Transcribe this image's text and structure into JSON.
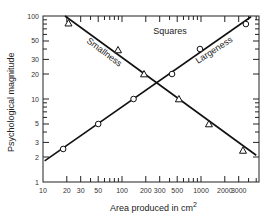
{
  "chart_data": {
    "type": "scatter",
    "title": "Squares",
    "xlabel": "Area produced in cm",
    "xlabel_superscript": "2",
    "ylabel": "Psychological magnitude",
    "xscale": "log",
    "yscale": "log",
    "xlim": [
      10,
      5500
    ],
    "ylim": [
      1,
      100
    ],
    "grid": false,
    "legend": "inline labels on lines",
    "x_ticks": [
      10,
      20,
      30,
      50,
      100,
      200,
      300,
      500,
      1000,
      2000,
      3000
    ],
    "x_tick_labels": [
      "10",
      "20",
      "30",
      "50",
      "100",
      "200",
      "300",
      "500",
      "1000",
      "2000",
      "3000"
    ],
    "y_ticks": [
      1,
      2,
      3,
      5,
      10,
      20,
      30,
      50,
      100
    ],
    "y_tick_labels": [
      "1",
      "2",
      "3",
      "5",
      "10",
      "20",
      "30",
      "50",
      "100"
    ],
    "series": [
      {
        "name": "Largeness",
        "marker": "circle",
        "points": [
          {
            "x": 18,
            "y": 2.5
          },
          {
            "x": 50,
            "y": 5
          },
          {
            "x": 140,
            "y": 10
          },
          {
            "x": 430,
            "y": 20
          },
          {
            "x": 970,
            "y": 40
          },
          {
            "x": 3700,
            "y": 80
          }
        ],
        "fit_line": {
          "x1": 10.5,
          "y1": 1.8,
          "x2": 4300,
          "y2": 98
        }
      },
      {
        "name": "Smallness",
        "marker": "triangle",
        "points": [
          {
            "x": 21,
            "y": 82
          },
          {
            "x": 89,
            "y": 39
          },
          {
            "x": 190,
            "y": 20
          },
          {
            "x": 525,
            "y": 10
          },
          {
            "x": 1260,
            "y": 5
          },
          {
            "x": 3400,
            "y": 2.4
          }
        ],
        "fit_line": {
          "x1": 19,
          "y1": 100,
          "x2": 5000,
          "y2": 2.1
        }
      }
    ]
  }
}
